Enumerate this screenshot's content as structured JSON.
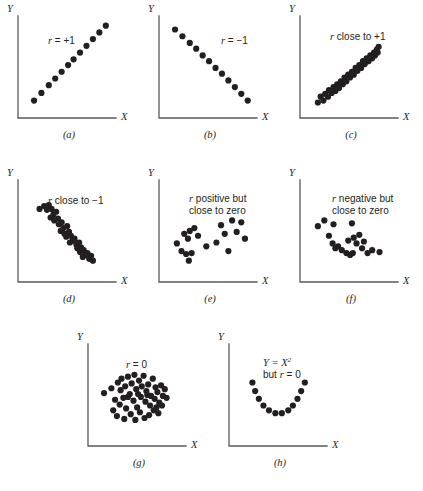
{
  "figure": {
    "background_color": "#ffffff",
    "dot_color": "#231f20",
    "axis_color": "#58595b",
    "axis_labels": {
      "x": "X",
      "y": "Y"
    }
  },
  "panels": [
    {
      "id": "a",
      "caption": "(a)",
      "annotation_lines": [
        "r = +1"
      ],
      "annotation_x": 30,
      "annotation_y": 28,
      "description": "Perfect positive linear relationship",
      "chart_data": {
        "type": "scatter",
        "title": "r = +1",
        "xlabel": "X",
        "ylabel": "Y",
        "xlim": [
          0,
          100
        ],
        "ylim": [
          0,
          100
        ],
        "grid": false,
        "points": [
          [
            12,
            14
          ],
          [
            20,
            22
          ],
          [
            28,
            30
          ],
          [
            35,
            37
          ],
          [
            42,
            44
          ],
          [
            49,
            51
          ],
          [
            55,
            57
          ],
          [
            62,
            64
          ],
          [
            69,
            71
          ],
          [
            76,
            78
          ],
          [
            83,
            85
          ],
          [
            90,
            92
          ]
        ]
      }
    },
    {
      "id": "b",
      "caption": "(b)",
      "annotation_lines": [
        "r = −1"
      ],
      "annotation_x": 62,
      "annotation_y": 28,
      "description": "Perfect negative linear relationship",
      "chart_data": {
        "type": "scatter",
        "title": "r = −1",
        "xlabel": "X",
        "ylabel": "Y",
        "xlim": [
          0,
          100
        ],
        "ylim": [
          0,
          100
        ],
        "grid": false,
        "points": [
          [
            12,
            88
          ],
          [
            20,
            81
          ],
          [
            28,
            74
          ],
          [
            35,
            68
          ],
          [
            42,
            61
          ],
          [
            49,
            55
          ],
          [
            56,
            48
          ],
          [
            63,
            42
          ],
          [
            70,
            35
          ],
          [
            77,
            28
          ],
          [
            84,
            21
          ],
          [
            91,
            14
          ]
        ]
      }
    },
    {
      "id": "c",
      "caption": "(c)",
      "annotation_lines": [
        "r close to +1"
      ],
      "annotation_x": 30,
      "annotation_y": 24,
      "description": "Strong positive linear relationship",
      "chart_data": {
        "type": "scatter",
        "title": "r close to +1",
        "xlabel": "X",
        "ylabel": "Y",
        "xlim": [
          0,
          100
        ],
        "ylim": [
          0,
          100
        ],
        "grid": false,
        "points": [
          [
            14,
            12
          ],
          [
            17,
            18
          ],
          [
            20,
            14
          ],
          [
            22,
            21
          ],
          [
            25,
            18
          ],
          [
            26,
            25
          ],
          [
            29,
            22
          ],
          [
            31,
            28
          ],
          [
            33,
            24
          ],
          [
            35,
            31
          ],
          [
            37,
            27
          ],
          [
            39,
            34
          ],
          [
            41,
            31
          ],
          [
            43,
            38
          ],
          [
            45,
            34
          ],
          [
            47,
            41
          ],
          [
            49,
            38
          ],
          [
            51,
            44
          ],
          [
            53,
            41
          ],
          [
            55,
            48
          ],
          [
            57,
            45
          ],
          [
            59,
            51
          ],
          [
            61,
            48
          ],
          [
            63,
            55
          ],
          [
            65,
            52
          ],
          [
            67,
            58
          ],
          [
            69,
            55
          ],
          [
            71,
            61
          ],
          [
            73,
            58
          ],
          [
            75,
            64
          ],
          [
            76,
            61
          ],
          [
            78,
            67
          ],
          [
            79,
            64
          ],
          [
            80,
            70
          ]
        ]
      }
    },
    {
      "id": "d",
      "caption": "(d)",
      "annotation_lines": [
        "r close to −1"
      ],
      "annotation_x": 30,
      "annotation_y": 24,
      "description": "Strong negative linear relationship",
      "chart_data": {
        "type": "scatter",
        "title": "r close to −1",
        "xlabel": "X",
        "ylabel": "Y",
        "xlim": [
          0,
          100
        ],
        "ylim": [
          0,
          100
        ],
        "grid": false,
        "points": [
          [
            18,
            72
          ],
          [
            23,
            75
          ],
          [
            26,
            71
          ],
          [
            28,
            76
          ],
          [
            31,
            72
          ],
          [
            33,
            66
          ],
          [
            36,
            69
          ],
          [
            30,
            63
          ],
          [
            34,
            60
          ],
          [
            38,
            62
          ],
          [
            39,
            56
          ],
          [
            42,
            58
          ],
          [
            44,
            52
          ],
          [
            41,
            49
          ],
          [
            45,
            46
          ],
          [
            48,
            54
          ],
          [
            50,
            48
          ],
          [
            47,
            43
          ],
          [
            52,
            44
          ],
          [
            54,
            39
          ],
          [
            51,
            37
          ],
          [
            56,
            41
          ],
          [
            58,
            35
          ],
          [
            61,
            37
          ],
          [
            59,
            31
          ],
          [
            63,
            32
          ],
          [
            62,
            27
          ],
          [
            66,
            29
          ],
          [
            68,
            24
          ],
          [
            65,
            22
          ],
          [
            70,
            26
          ],
          [
            72,
            20
          ],
          [
            74,
            23
          ],
          [
            76,
            18
          ]
        ]
      }
    },
    {
      "id": "e",
      "caption": "(e)",
      "annotation_lines": [
        "r positive but",
        "close to zero"
      ],
      "annotation_x": 30,
      "annotation_y": 22,
      "description": "Weak positive relationship",
      "chart_data": {
        "type": "scatter",
        "title": "r positive but close to zero",
        "xlabel": "X",
        "ylabel": "Y",
        "xlim": [
          0,
          100
        ],
        "ylim": [
          0,
          100
        ],
        "grid": false,
        "points": [
          [
            14,
            36
          ],
          [
            19,
            28
          ],
          [
            24,
            25
          ],
          [
            22,
            46
          ],
          [
            28,
            49
          ],
          [
            26,
            41
          ],
          [
            30,
            26
          ],
          [
            27,
            18
          ],
          [
            33,
            52
          ],
          [
            37,
            44
          ],
          [
            46,
            33
          ],
          [
            57,
            37
          ],
          [
            62,
            55
          ],
          [
            66,
            46
          ],
          [
            70,
            28
          ],
          [
            74,
            60
          ],
          [
            79,
            48
          ],
          [
            84,
            58
          ],
          [
            88,
            41
          ]
        ]
      }
    },
    {
      "id": "f",
      "caption": "(f)",
      "annotation_lines": [
        "r negative but",
        "close to zero"
      ],
      "annotation_x": 32,
      "annotation_y": 22,
      "description": "Weak negative relationship",
      "chart_data": {
        "type": "scatter",
        "title": "r negative but close to zero",
        "xlabel": "X",
        "ylabel": "Y",
        "xlim": [
          0,
          100
        ],
        "ylim": [
          0,
          100
        ],
        "grid": false,
        "points": [
          [
            14,
            54
          ],
          [
            21,
            60
          ],
          [
            26,
            44
          ],
          [
            31,
            56
          ],
          [
            30,
            36
          ],
          [
            33,
            31
          ],
          [
            36,
            33
          ],
          [
            40,
            29
          ],
          [
            45,
            26
          ],
          [
            49,
            24
          ],
          [
            52,
            26
          ],
          [
            47,
            39
          ],
          [
            53,
            42
          ],
          [
            56,
            36
          ],
          [
            51,
            57
          ],
          [
            59,
            45
          ],
          [
            62,
            31
          ],
          [
            64,
            38
          ],
          [
            68,
            26
          ],
          [
            73,
            29
          ],
          [
            81,
            27
          ]
        ]
      }
    },
    {
      "id": "g",
      "caption": "(g)",
      "annotation_lines": [
        "r = 0"
      ],
      "annotation_x": 38,
      "annotation_y": 24,
      "description": "No relationship, random cloud",
      "chart_data": {
        "type": "scatter",
        "title": "r = 0",
        "xlabel": "X",
        "ylabel": "Y",
        "xlim": [
          0,
          100
        ],
        "ylim": [
          0,
          100
        ],
        "grid": false,
        "points": [
          [
            12,
            51
          ],
          [
            20,
            56
          ],
          [
            24,
            44
          ],
          [
            22,
            33
          ],
          [
            27,
            62
          ],
          [
            30,
            54
          ],
          [
            31,
            66
          ],
          [
            29,
            39
          ],
          [
            26,
            27
          ],
          [
            33,
            46
          ],
          [
            35,
            58
          ],
          [
            38,
            68
          ],
          [
            36,
            35
          ],
          [
            34,
            24
          ],
          [
            40,
            50
          ],
          [
            42,
            61
          ],
          [
            44,
            43
          ],
          [
            41,
            29
          ],
          [
            45,
            70
          ],
          [
            47,
            55
          ],
          [
            48,
            36
          ],
          [
            46,
            23
          ],
          [
            50,
            64
          ],
          [
            52,
            47
          ],
          [
            53,
            58
          ],
          [
            51,
            31
          ],
          [
            55,
            69
          ],
          [
            57,
            42
          ],
          [
            58,
            53
          ],
          [
            56,
            25
          ],
          [
            60,
            60
          ],
          [
            62,
            38
          ],
          [
            63,
            48
          ],
          [
            61,
            28
          ],
          [
            65,
            66
          ],
          [
            67,
            45
          ],
          [
            68,
            57
          ],
          [
            66,
            33
          ],
          [
            70,
            52
          ],
          [
            72,
            41
          ],
          [
            74,
            59
          ],
          [
            71,
            30
          ],
          [
            76,
            48
          ],
          [
            78,
            55
          ],
          [
            75,
            38
          ],
          [
            80,
            46
          ],
          [
            38,
            47
          ],
          [
            49,
            50
          ],
          [
            59,
            49
          ],
          [
            69,
            36
          ]
        ]
      }
    },
    {
      "id": "h",
      "caption": "(h)",
      "annotation_lines": [
        "Y = X²",
        "but r = 0"
      ],
      "annotation_x": 34,
      "annotation_y": 22,
      "description": "Perfect curvilinear (quadratic) relationship but r equals zero",
      "chart_data": {
        "type": "scatter",
        "title": "Y = X² but r = 0",
        "xlabel": "X",
        "ylabel": "Y",
        "xlim": [
          0,
          100
        ],
        "ylim": [
          0,
          100
        ],
        "grid": false,
        "points": [
          [
            20,
            62
          ],
          [
            23,
            53
          ],
          [
            27,
            45
          ],
          [
            32,
            38
          ],
          [
            38,
            33
          ],
          [
            45,
            30
          ],
          [
            52,
            30
          ],
          [
            59,
            33
          ],
          [
            64,
            38
          ],
          [
            69,
            45
          ],
          [
            73,
            53
          ],
          [
            77,
            62
          ]
        ]
      }
    }
  ],
  "footer": {
    "text": ""
  }
}
